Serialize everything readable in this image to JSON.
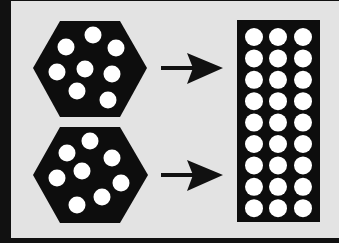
{
  "diagram": {
    "colors": {
      "background": "#e3e3e3",
      "frame": "#111111",
      "shape_fill": "#0d0d0d",
      "hole_fill": "#ffffff",
      "arrow": "#111111"
    },
    "hexagons": [
      {
        "id": "top-hexagon",
        "points": "33,68 60,21 120,21 147,68 120,117 60,117",
        "holes": [
          [
            93,
            35
          ],
          [
            66,
            47
          ],
          [
            116,
            48
          ],
          [
            57,
            72
          ],
          [
            85,
            69
          ],
          [
            112,
            74
          ],
          [
            77,
            91
          ],
          [
            108,
            100
          ]
        ]
      },
      {
        "id": "bottom-hexagon",
        "points": "33,175 60,127 120,127 148,175 120,223 60,223",
        "holes": [
          [
            90,
            141
          ],
          [
            67,
            153
          ],
          [
            112,
            158
          ],
          [
            82,
            171
          ],
          [
            57,
            178
          ],
          [
            121,
            183
          ],
          [
            102,
            197
          ],
          [
            77,
            205
          ]
        ]
      }
    ],
    "hole_radius": 8.5,
    "arrows": [
      {
        "id": "top-arrow",
        "y": 68,
        "x_start": 161,
        "x_tip": 223
      },
      {
        "id": "bottom-arrow",
        "y": 175,
        "x_start": 161,
        "x_tip": 223
      }
    ],
    "grid": {
      "x": 237,
      "y": 20,
      "width": 83,
      "height": 202,
      "rows": 9,
      "cols": 3,
      "col_centers": [
        254,
        278,
        303
      ],
      "first_row_y": 37,
      "row_spacing": 21.4,
      "hole_radius": 9
    }
  }
}
